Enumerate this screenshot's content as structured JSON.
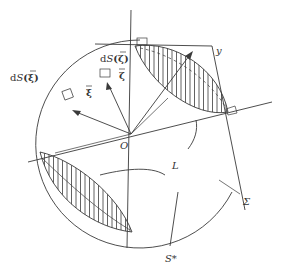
{
  "diagram": {
    "labels": {
      "origin": "O",
      "ds_xi_prefix": "d",
      "ds_xi_S": "S",
      "ds_xi_arg": "(ξ)",
      "ds_zeta_prefix": "d",
      "ds_zeta_S": "S",
      "ds_zeta_arg": "(ζ)",
      "xi": "ξ",
      "zeta": "ζ",
      "y": "y",
      "L": "L",
      "sigma": "Σ",
      "s_star": "S*"
    },
    "colors": {
      "stroke": "#3a3a3a",
      "background": "#ffffff"
    }
  }
}
